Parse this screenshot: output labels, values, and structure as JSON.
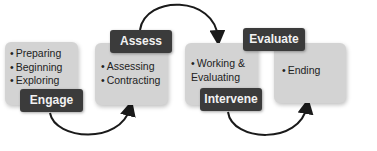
{
  "stages": [
    {
      "label": "Engage",
      "items": [
        "Preparing",
        "Beginning",
        "Exploring"
      ]
    },
    {
      "label": "Assess",
      "items": [
        "Assessing",
        "Contracting"
      ]
    },
    {
      "label": "Intervene",
      "items": [
        "Working & Evaluating"
      ]
    },
    {
      "label": "Evaluate",
      "items": [
        "Ending"
      ]
    }
  ],
  "arrows": [
    {
      "from": "Engage",
      "to": "Assess"
    },
    {
      "from": "Assess",
      "to": "Intervene"
    },
    {
      "from": "Intervene",
      "to": "Evaluate"
    }
  ],
  "colors": {
    "box": "#d3d3d3",
    "label_bg": "#3b3b3b",
    "label_text": "#f2f2f2",
    "arrow": "#1a1a1a"
  }
}
